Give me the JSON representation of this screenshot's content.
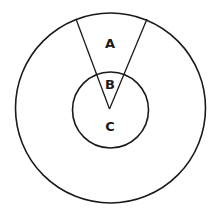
{
  "diagram": {
    "type": "concentric-circles-with-sector",
    "stroke_color": "#1a1a1a",
    "background": "#ffffff",
    "outer_circle": {
      "cx": 110.5,
      "cy": 108,
      "r": 95
    },
    "inner_circle": {
      "cx": 110.5,
      "cy": 110,
      "r": 38
    },
    "sector": {
      "apex": [
        109.5,
        109
      ],
      "left_end": [
        76,
        19
      ],
      "right_end": [
        147,
        19
      ]
    },
    "labels": [
      {
        "id": "A",
        "text": "A",
        "x": 110,
        "y": 48
      },
      {
        "id": "B",
        "text": "B",
        "x": 110,
        "y": 89
      },
      {
        "id": "C",
        "text": "C",
        "x": 110,
        "y": 131
      }
    ]
  }
}
